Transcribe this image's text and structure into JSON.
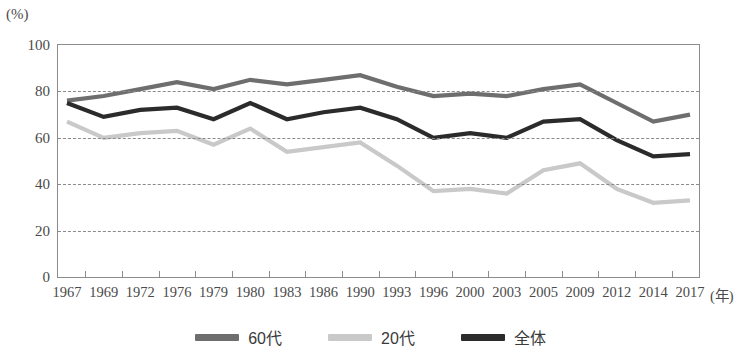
{
  "axis": {
    "unit_label": "(%)",
    "x_unit_label": "(年)",
    "y_ticks": [
      "100",
      "80",
      "60",
      "40",
      "20",
      "0"
    ],
    "y_tick_values": [
      100,
      80,
      60,
      40,
      20,
      0
    ],
    "ylim": [
      0,
      100
    ]
  },
  "legend": {
    "items": [
      {
        "label": "60代",
        "color": "#6e6e6e"
      },
      {
        "label": "20代",
        "color": "#c9c9c9"
      },
      {
        "label": "全体",
        "color": "#2b2b2b"
      }
    ]
  },
  "chart_data": {
    "type": "line",
    "title": "",
    "subtitle": "",
    "xlabel": "(年)",
    "ylabel": "(%)",
    "ylim": [
      0,
      100
    ],
    "xlim_categories": 18,
    "grid": true,
    "grid_axis": "y",
    "grid_values": [
      20,
      40,
      60,
      80
    ],
    "legend_position": "bottom-center",
    "categories": [
      "1967",
      "1969",
      "1972",
      "1976",
      "1979",
      "1980",
      "1983",
      "1986",
      "1990",
      "1993",
      "1996",
      "2000",
      "2003",
      "2005",
      "2009",
      "2012",
      "2014",
      "2017"
    ],
    "series": [
      {
        "name": "60代",
        "color": "#6e6e6e",
        "values": [
          76,
          78,
          81,
          84,
          81,
          85,
          83,
          85,
          87,
          82,
          78,
          79,
          78,
          81,
          83,
          75,
          67,
          70
        ]
      },
      {
        "name": "20代",
        "color": "#c9c9c9",
        "values": [
          67,
          60,
          62,
          63,
          57,
          64,
          54,
          56,
          58,
          48,
          37,
          38,
          36,
          46,
          49,
          38,
          32,
          33
        ]
      },
      {
        "name": "全体",
        "color": "#2b2b2b",
        "values": [
          75,
          69,
          72,
          73,
          68,
          75,
          68,
          71,
          73,
          68,
          60,
          62,
          60,
          67,
          68,
          59,
          52,
          53
        ]
      }
    ]
  }
}
